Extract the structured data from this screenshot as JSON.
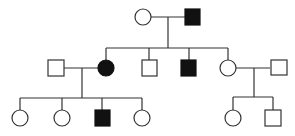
{
  "diagram": {
    "type": "pedigree",
    "colors": {
      "affected": "#111111",
      "unaffected": "#ffffff",
      "line": "#333333"
    },
    "generations": [
      {
        "label": "I",
        "individuals": [
          {
            "id": "I-1",
            "sex": "female",
            "affected": false
          },
          {
            "id": "I-2",
            "sex": "male",
            "affected": true
          }
        ]
      },
      {
        "label": "II",
        "individuals": [
          {
            "id": "II-1",
            "sex": "male",
            "affected": false,
            "role": "spouse of II-2"
          },
          {
            "id": "II-2",
            "sex": "female",
            "affected": true
          },
          {
            "id": "II-3",
            "sex": "male",
            "affected": false
          },
          {
            "id": "II-4",
            "sex": "male",
            "affected": true
          },
          {
            "id": "II-5",
            "sex": "female",
            "affected": false
          },
          {
            "id": "II-6",
            "sex": "male",
            "affected": false,
            "role": "spouse of II-5"
          }
        ]
      },
      {
        "label": "III",
        "individuals": [
          {
            "id": "III-1",
            "sex": "female",
            "affected": false
          },
          {
            "id": "III-2",
            "sex": "female",
            "affected": false
          },
          {
            "id": "III-3",
            "sex": "male",
            "affected": true
          },
          {
            "id": "III-4",
            "sex": "female",
            "affected": false
          },
          {
            "id": "III-5",
            "sex": "female",
            "affected": false
          },
          {
            "id": "III-6",
            "sex": "male",
            "affected": false
          }
        ]
      }
    ],
    "matings": [
      {
        "partners": [
          "I-1",
          "I-2"
        ],
        "children": [
          "II-2",
          "II-3",
          "II-4",
          "II-5"
        ]
      },
      {
        "partners": [
          "II-1",
          "II-2"
        ],
        "children": [
          "III-1",
          "III-2",
          "III-3",
          "III-4"
        ]
      },
      {
        "partners": [
          "II-5",
          "II-6"
        ],
        "children": [
          "III-5",
          "III-6"
        ]
      }
    ]
  }
}
